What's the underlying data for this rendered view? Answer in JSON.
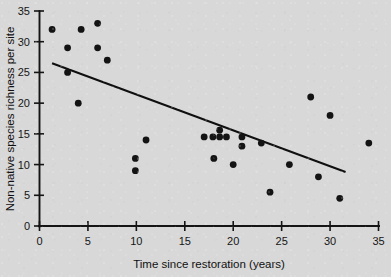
{
  "chart_data": {
    "type": "scatter",
    "title": "",
    "xlabel": "Time since restoration (years)",
    "ylabel": "Non-native species richness per site",
    "xlim": [
      0,
      35
    ],
    "ylim": [
      0,
      35
    ],
    "xticks": [
      0,
      5,
      10,
      15,
      20,
      25,
      30,
      35
    ],
    "yticks": [
      0,
      5,
      10,
      15,
      20,
      25,
      30,
      35
    ],
    "xtick_labels": [
      "0",
      "5",
      "10",
      "15",
      "20",
      "25",
      "30",
      "35"
    ],
    "ytick_labels": [
      "0",
      "5",
      "10",
      "15",
      "20",
      "25",
      "30",
      "35"
    ],
    "grid": false,
    "legend": null,
    "marker": "filled-circle",
    "marker_color": "#131313",
    "background_color": "#d8d8d8",
    "points": [
      {
        "x": 1.3,
        "y": 32
      },
      {
        "x": 2.9,
        "y": 29
      },
      {
        "x": 2.9,
        "y": 25
      },
      {
        "x": 4.3,
        "y": 32
      },
      {
        "x": 6.0,
        "y": 33
      },
      {
        "x": 6.0,
        "y": 29
      },
      {
        "x": 7.0,
        "y": 27
      },
      {
        "x": 4.0,
        "y": 20
      },
      {
        "x": 9.9,
        "y": 11
      },
      {
        "x": 9.9,
        "y": 9
      },
      {
        "x": 11.0,
        "y": 14
      },
      {
        "x": 17.0,
        "y": 14.5
      },
      {
        "x": 17.9,
        "y": 14.5
      },
      {
        "x": 18.6,
        "y": 14.5
      },
      {
        "x": 18.6,
        "y": 15.6
      },
      {
        "x": 19.3,
        "y": 14.5
      },
      {
        "x": 18.0,
        "y": 11.0
      },
      {
        "x": 20.0,
        "y": 10.0
      },
      {
        "x": 20.9,
        "y": 14.5
      },
      {
        "x": 20.9,
        "y": 13.0
      },
      {
        "x": 22.9,
        "y": 13.5
      },
      {
        "x": 23.8,
        "y": 5.5
      },
      {
        "x": 25.8,
        "y": 10.0
      },
      {
        "x": 28.0,
        "y": 21
      },
      {
        "x": 28.8,
        "y": 8.0
      },
      {
        "x": 30.0,
        "y": 18
      },
      {
        "x": 31.0,
        "y": 4.5
      },
      {
        "x": 34.0,
        "y": 13.5
      }
    ],
    "trend_line": {
      "type": "linear-fit",
      "x_start": 1.3,
      "y_start": 26.5,
      "x_end": 31.6,
      "y_end": 8.8
    }
  }
}
